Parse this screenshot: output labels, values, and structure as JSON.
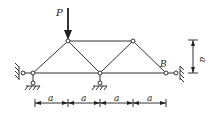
{
  "diagram": {
    "type": "truss",
    "labels": {
      "load": "P",
      "support_b": "B",
      "dim_vertical": "a",
      "dims_horizontal": [
        "a",
        "a",
        "a",
        "a"
      ]
    },
    "colors": {
      "stroke": "#333333",
      "background": "#ffffff"
    }
  }
}
